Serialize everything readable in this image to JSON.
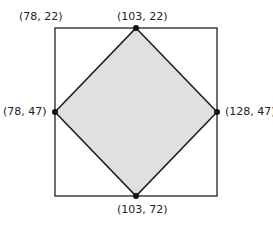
{
  "diagram": {
    "square": {
      "x": 55,
      "y": 28,
      "width": 162,
      "height": 168
    },
    "fill_color": "#e0e0e0",
    "stroke_color": "#222222",
    "points": [
      {
        "label": "(78, 22)",
        "role": "top-left-corner"
      },
      {
        "label": "(103, 22)",
        "role": "top-vertex"
      },
      {
        "label": "(78, 47)",
        "role": "left-vertex"
      },
      {
        "label": "(128, 47)",
        "role": "right-vertex"
      },
      {
        "label": "(103, 72)",
        "role": "bottom-vertex"
      }
    ]
  }
}
